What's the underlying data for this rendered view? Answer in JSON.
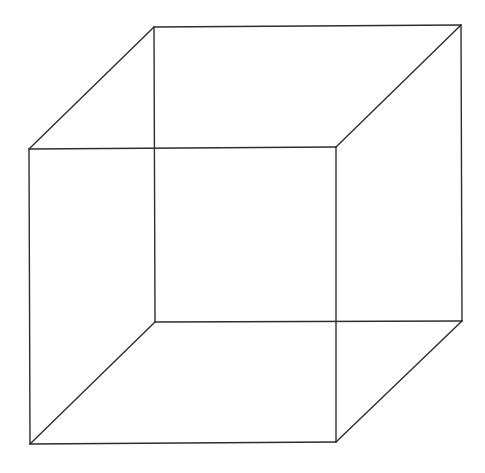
{
  "diagram": {
    "type": "wireframe-cube",
    "background": "#ffffff",
    "stroke_color": "#2e2e2e",
    "stroke_width": 1.4,
    "vertices": {
      "front_top_left": [
        29,
        149
      ],
      "front_top_right": [
        336,
        147
      ],
      "front_bottom_left": [
        30,
        444
      ],
      "front_bottom_right": [
        336,
        442
      ],
      "back_top_left": [
        154,
        27
      ],
      "back_top_right": [
        461,
        25
      ],
      "back_bottom_left": [
        155,
        322
      ],
      "back_bottom_right": [
        462,
        321
      ]
    },
    "edges": [
      [
        "front_top_left",
        "front_top_right"
      ],
      [
        "front_top_right",
        "front_bottom_right"
      ],
      [
        "front_bottom_right",
        "front_bottom_left"
      ],
      [
        "front_bottom_left",
        "front_top_left"
      ],
      [
        "back_top_left",
        "back_top_right"
      ],
      [
        "back_top_right",
        "back_bottom_right"
      ],
      [
        "back_bottom_right",
        "back_bottom_left"
      ],
      [
        "back_bottom_left",
        "back_top_left"
      ],
      [
        "front_top_left",
        "back_top_left"
      ],
      [
        "front_top_right",
        "back_top_right"
      ],
      [
        "front_bottom_left",
        "back_bottom_left"
      ],
      [
        "front_bottom_right",
        "back_bottom_right"
      ]
    ]
  }
}
